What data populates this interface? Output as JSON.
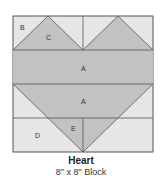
{
  "diagram": {
    "title": "Heart",
    "subtitle": "8\" x 8\" Block",
    "labels": {
      "B": "B",
      "C": "C",
      "A1": "A",
      "A2": "A",
      "D": "D",
      "E": "E"
    },
    "colors": {
      "background": "#e6e6e6",
      "fill": "#c2c2c2",
      "line": "#555555"
    }
  }
}
